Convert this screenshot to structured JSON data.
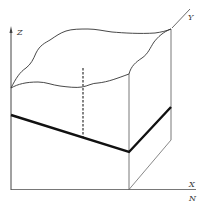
{
  "diagram": {
    "type": "3d-block-diagram",
    "axes": {
      "z_label": "Z",
      "y_label": "Y",
      "x_label": "X",
      "n_label": "N"
    },
    "colors": {
      "line": "#333333",
      "thick_line": "#111111",
      "dashed": "#666666",
      "background": "#ffffff"
    }
  }
}
